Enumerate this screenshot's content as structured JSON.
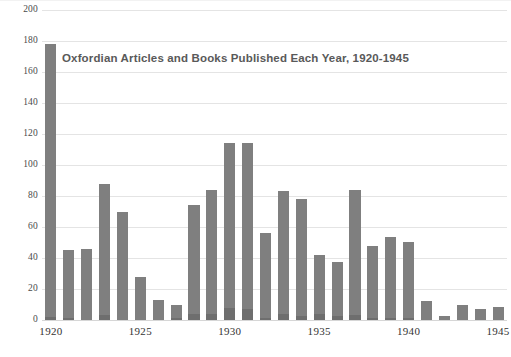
{
  "chart_data": {
    "type": "bar",
    "title": "Oxfordian Articles and Books Published Each Year, 1920-1945",
    "xlabel": "",
    "ylabel": "",
    "ylim": [
      0,
      200
    ],
    "ytick_values": [
      0,
      20,
      40,
      60,
      80,
      100,
      120,
      140,
      160,
      180,
      200
    ],
    "ytick_labels": [
      "0",
      "20",
      "40",
      "60",
      "80",
      "100",
      "120",
      "140",
      "160",
      "180",
      "200"
    ],
    "xtick_labels": [
      "1920",
      "1925",
      "1930",
      "1935",
      "1940",
      "1945"
    ],
    "xtick_categories": [
      "1920",
      "1925",
      "1930",
      "1935",
      "1940",
      "1945"
    ],
    "grid": true,
    "grid_axis": "y",
    "legend": false,
    "legend_position": "none",
    "bar_color": "#7f7f7f",
    "bar_base_color": "#6e6e6e",
    "grid_color": "#e4e4e4",
    "categories": [
      "1920",
      "1921",
      "1922",
      "1923",
      "1924",
      "1925",
      "1926",
      "1927",
      "1928",
      "1929",
      "1930",
      "1931",
      "1932",
      "1933",
      "1934",
      "1935",
      "1936",
      "1937",
      "1938",
      "1939",
      "1940",
      "1941",
      "1942",
      "1943",
      "1944",
      "1945"
    ],
    "values": [
      178,
      45,
      45.5,
      88,
      69.5,
      28,
      13,
      9.5,
      74,
      84,
      114,
      114,
      56,
      83,
      78,
      42,
      37.5,
      84,
      48,
      53.5,
      50.5,
      12,
      2.5,
      10,
      7,
      8.5
    ],
    "base_segment_values": [
      2,
      1.5,
      0,
      3.5,
      0,
      0,
      0,
      1,
      4,
      4,
      8,
      7,
      1.5,
      4,
      2.5,
      4,
      2.5,
      3,
      1.5,
      1.5,
      1.5,
      0,
      0,
      0,
      0,
      0
    ],
    "series": [
      {
        "name": "Articles and Books",
        "values": [
          178,
          45,
          45.5,
          88,
          69.5,
          28,
          13,
          9.5,
          74,
          84,
          114,
          114,
          56,
          83,
          78,
          42,
          37.5,
          84,
          48,
          53.5,
          50.5,
          12,
          2.5,
          10,
          7,
          8.5
        ]
      }
    ]
  }
}
